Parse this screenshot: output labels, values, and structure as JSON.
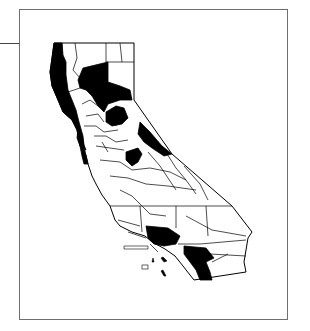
{
  "map": {
    "subject": "California counties",
    "style": "black-and-white choropleth",
    "colors": {
      "shaded": "#000000",
      "unshaded": "#ffffff",
      "border": "#000000",
      "frame": "#6f6f6f"
    },
    "legend": null,
    "shaded_regions": [
      "Del Norte / Humboldt / Mendocino coastal strip",
      "Siskiyou-Shasta-Lassen block (Trinity/Shasta/Plumas)",
      "Sierra/Nevada-Placer area",
      "Alpine/Mono eastern strip",
      "Tuolumne area",
      "Marin / Sonoma coast",
      "Los Angeles",
      "Riverside / San Diego western strip"
    ],
    "islands_visible": true
  }
}
